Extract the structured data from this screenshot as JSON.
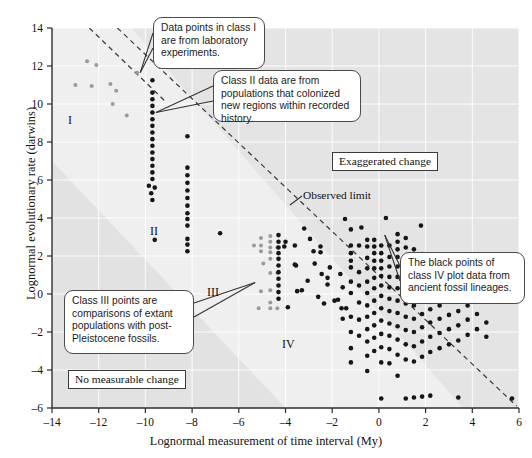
{
  "chart_data": {
    "type": "scatter",
    "title": "",
    "xlabel": "Lognormal measurement of time interval (My)",
    "ylabel": "Lognormal evolutionary rate (darwins)",
    "xlim": [
      -14,
      6
    ],
    "ylim": [
      -6,
      14
    ],
    "xticks": [
      -14,
      -12,
      -10,
      -8,
      -6,
      -4,
      -2,
      0,
      2,
      4,
      6
    ],
    "xtick_labels": [
      "–14",
      "–12",
      "–10",
      "–8",
      "–6",
      "–4",
      "–2",
      "0",
      "2",
      "4",
      "6"
    ],
    "yticks": [
      -6,
      -4,
      -2,
      0,
      2,
      4,
      6,
      8,
      10,
      12,
      14
    ],
    "ytick_labels": [
      "–6",
      "–4",
      "–2",
      "0",
      "2",
      "4",
      "6",
      "8",
      "10",
      "12",
      "14"
    ],
    "grid": true,
    "legend_position": "none",
    "colors": {
      "class_light": "#9a9a9a",
      "class_dark": "#161616",
      "shade_upper": "#e3e3e3",
      "shade_lower": "#e0e0e0",
      "axis": "#2b2b2b",
      "grid": "#ffffff",
      "dashed_line": "#3a3a3a"
    },
    "series": [
      {
        "name": "Class I",
        "style": "light",
        "points": [
          [
            -13.0,
            11.0
          ],
          [
            -12.5,
            12.25
          ],
          [
            -12.3,
            10.95
          ],
          [
            -12.1,
            12.05
          ],
          [
            -11.5,
            11.05
          ],
          [
            -11.25,
            10.7
          ],
          [
            -11.4,
            10.0
          ],
          [
            -10.8,
            9.4
          ],
          [
            -10.35,
            11.65
          ]
        ]
      },
      {
        "name": "Class II",
        "style": "dark",
        "points": [
          [
            -9.7,
            11.25
          ],
          [
            -9.7,
            10.6
          ],
          [
            -9.7,
            10.25
          ],
          [
            -9.7,
            9.9
          ],
          [
            -9.7,
            9.55
          ],
          [
            -9.7,
            9.2
          ],
          [
            -9.7,
            8.85
          ],
          [
            -9.7,
            8.5
          ],
          [
            -9.7,
            8.15
          ],
          [
            -9.7,
            7.8
          ],
          [
            -9.7,
            7.45
          ],
          [
            -9.7,
            7.1
          ],
          [
            -9.7,
            6.75
          ],
          [
            -9.7,
            6.4
          ],
          [
            -9.7,
            6.05
          ],
          [
            -9.85,
            5.7
          ],
          [
            -9.6,
            5.6
          ],
          [
            -9.75,
            5.3
          ],
          [
            -9.7,
            4.95
          ],
          [
            -8.2,
            8.3
          ],
          [
            -8.2,
            6.65
          ],
          [
            -8.2,
            6.25
          ],
          [
            -8.2,
            5.85
          ],
          [
            -8.2,
            5.45
          ],
          [
            -8.2,
            5.05
          ],
          [
            -8.2,
            4.65
          ],
          [
            -8.2,
            4.25
          ],
          [
            -8.2,
            3.95
          ],
          [
            -8.2,
            3.6
          ],
          [
            -8.2,
            2.9
          ],
          [
            -8.2,
            2.6
          ],
          [
            -8.2,
            2.25
          ],
          [
            -9.6,
            2.85
          ],
          [
            -6.8,
            3.2
          ]
        ]
      },
      {
        "name": "Class III",
        "style": "light",
        "points": [
          [
            -5.05,
            2.95
          ],
          [
            -5.05,
            2.55
          ],
          [
            -5.05,
            2.25
          ],
          [
            -4.65,
            3.05
          ],
          [
            -4.65,
            2.75
          ],
          [
            -4.65,
            2.45
          ],
          [
            -4.65,
            2.2
          ],
          [
            -4.65,
            1.85
          ],
          [
            -4.65,
            1.1
          ],
          [
            -4.65,
            0.2
          ],
          [
            -4.65,
            -0.45
          ],
          [
            -4.65,
            -0.75
          ],
          [
            -4.35,
            -0.75
          ],
          [
            -4.35,
            1.1
          ],
          [
            -4.35,
            2.45
          ],
          [
            -5.15,
            -0.75
          ],
          [
            -5.05,
            0.15
          ],
          [
            -5.35,
            2.55
          ],
          [
            -4.95,
            1.6
          ]
        ]
      },
      {
        "name": "Class IV",
        "style": "dark",
        "points": [
          [
            -4.3,
            3.1
          ],
          [
            -4.3,
            2.75
          ],
          [
            -4.3,
            2.45
          ],
          [
            -4.3,
            2.15
          ],
          [
            -4.3,
            1.85
          ],
          [
            -4.3,
            1.5
          ],
          [
            -4.3,
            1.15
          ],
          [
            -4.3,
            0.8
          ],
          [
            -4.3,
            0.45
          ],
          [
            -4.3,
            0.1
          ],
          [
            -4.3,
            -0.25
          ],
          [
            -4.05,
            2.5
          ],
          [
            -4.0,
            2.75
          ],
          [
            -3.6,
            2.55
          ],
          [
            -3.9,
            -0.7
          ],
          [
            -3.55,
            1.5
          ],
          [
            -3.5,
            0.15
          ],
          [
            -3.3,
            0.2
          ],
          [
            -3.6,
            1.55
          ],
          [
            -2.8,
            2.25
          ],
          [
            -2.5,
            2.5
          ],
          [
            -2.5,
            2.2
          ],
          [
            -2.2,
            0.85
          ],
          [
            -2.2,
            0.5
          ],
          [
            -2.1,
            1.4
          ],
          [
            -1.75,
            -0.3
          ],
          [
            -1.6,
            -0.75
          ],
          [
            -1.4,
            -0.75
          ],
          [
            -1.2,
            3.4
          ],
          [
            -1.2,
            2.55
          ],
          [
            -1.2,
            2.15
          ],
          [
            -1.2,
            1.75
          ],
          [
            -1.2,
            1.4
          ],
          [
            -1.2,
            0.65
          ],
          [
            -1.2,
            0.05
          ],
          [
            -1.2,
            -1.2
          ],
          [
            -1.2,
            -2.0
          ],
          [
            -1.2,
            -2.85
          ],
          [
            -1.2,
            -3.6
          ],
          [
            -0.85,
            2.55
          ],
          [
            -0.85,
            1.15
          ],
          [
            -0.85,
            0.45
          ],
          [
            -0.85,
            -0.45
          ],
          [
            -0.85,
            -1.35
          ],
          [
            -0.85,
            -2.2
          ],
          [
            -1.55,
            0.35
          ],
          [
            -1.55,
            -1.3
          ],
          [
            -1.9,
            -0.35
          ],
          [
            -1.65,
            1.05
          ],
          [
            -0.5,
            2.85
          ],
          [
            -0.5,
            2.5
          ],
          [
            -0.5,
            1.9
          ],
          [
            -0.5,
            1.35
          ],
          [
            -0.5,
            0.65
          ],
          [
            -0.5,
            0.05
          ],
          [
            -0.5,
            -0.6
          ],
          [
            -0.5,
            -1.2
          ],
          [
            -0.5,
            -1.85
          ],
          [
            -0.5,
            -2.5
          ],
          [
            -0.5,
            -3.25
          ],
          [
            -0.5,
            -4.05
          ],
          [
            -0.2,
            2.85
          ],
          [
            -0.2,
            2.5
          ],
          [
            -0.2,
            2.15
          ],
          [
            -0.2,
            1.75
          ],
          [
            -0.2,
            1.35
          ],
          [
            -0.2,
            0.85
          ],
          [
            -0.2,
            0.3
          ],
          [
            -0.2,
            -0.35
          ],
          [
            -0.2,
            -1.0
          ],
          [
            -0.2,
            -1.65
          ],
          [
            -0.2,
            -2.3
          ],
          [
            -0.2,
            -3.0
          ],
          [
            0.1,
            2.55
          ],
          [
            0.1,
            2.15
          ],
          [
            0.1,
            1.75
          ],
          [
            0.1,
            1.35
          ],
          [
            0.1,
            0.95
          ],
          [
            0.1,
            0.45
          ],
          [
            0.1,
            -0.1
          ],
          [
            0.1,
            -0.75
          ],
          [
            0.1,
            -1.4
          ],
          [
            0.1,
            -2.1
          ],
          [
            0.1,
            -2.8
          ],
          [
            0.1,
            -3.6
          ],
          [
            0.1,
            -5.5
          ],
          [
            0.45,
            2.55
          ],
          [
            0.45,
            1.95
          ],
          [
            0.45,
            1.45
          ],
          [
            0.45,
            0.9
          ],
          [
            0.45,
            0.35
          ],
          [
            0.45,
            -0.25
          ],
          [
            0.45,
            -0.9
          ],
          [
            0.45,
            -1.55
          ],
          [
            0.45,
            -2.2
          ],
          [
            0.45,
            -2.9
          ],
          [
            0.45,
            -3.65
          ],
          [
            0.8,
            3.15
          ],
          [
            0.8,
            2.75
          ],
          [
            0.8,
            2.35
          ],
          [
            0.8,
            1.95
          ],
          [
            0.8,
            1.45
          ],
          [
            0.8,
            0.9
          ],
          [
            0.8,
            0.3
          ],
          [
            0.8,
            -0.35
          ],
          [
            0.8,
            -1.0
          ],
          [
            0.8,
            -1.7
          ],
          [
            0.8,
            -2.4
          ],
          [
            0.8,
            -3.2
          ],
          [
            0.8,
            -4.3
          ],
          [
            1.15,
            2.95
          ],
          [
            1.15,
            2.45
          ],
          [
            1.15,
            1.95
          ],
          [
            1.15,
            1.4
          ],
          [
            1.15,
            0.8
          ],
          [
            1.15,
            0.15
          ],
          [
            1.15,
            -0.5
          ],
          [
            1.15,
            -1.2
          ],
          [
            1.15,
            -1.9
          ],
          [
            1.15,
            -2.65
          ],
          [
            1.15,
            -3.45
          ],
          [
            1.15,
            -5.5
          ],
          [
            1.5,
            2.35
          ],
          [
            1.5,
            1.85
          ],
          [
            1.5,
            1.3
          ],
          [
            1.5,
            0.7
          ],
          [
            1.5,
            0.05
          ],
          [
            1.5,
            -0.6
          ],
          [
            1.5,
            -1.3
          ],
          [
            1.5,
            -2.0
          ],
          [
            1.5,
            -2.75
          ],
          [
            1.5,
            -3.55
          ],
          [
            1.5,
            -5.45
          ],
          [
            1.85,
            2.1
          ],
          [
            1.85,
            1.55
          ],
          [
            1.85,
            0.95
          ],
          [
            1.85,
            0.3
          ],
          [
            1.85,
            -0.35
          ],
          [
            1.85,
            -1.05
          ],
          [
            1.85,
            -1.75
          ],
          [
            1.85,
            -2.5
          ],
          [
            1.85,
            -3.3
          ],
          [
            1.85,
            -5.4
          ],
          [
            2.2,
            1.75
          ],
          [
            2.2,
            1.15
          ],
          [
            2.2,
            0.55
          ],
          [
            2.2,
            -0.1
          ],
          [
            2.2,
            -0.8
          ],
          [
            2.2,
            -1.5
          ],
          [
            2.2,
            -2.25
          ],
          [
            2.2,
            -3.05
          ],
          [
            2.2,
            -5.35
          ],
          [
            2.6,
            1.35
          ],
          [
            2.6,
            0.75
          ],
          [
            2.6,
            0.1
          ],
          [
            2.6,
            -0.6
          ],
          [
            2.6,
            -1.3
          ],
          [
            2.6,
            -2.05
          ],
          [
            2.6,
            -2.85
          ],
          [
            3.0,
            0.95
          ],
          [
            3.0,
            0.3
          ],
          [
            3.0,
            -0.4
          ],
          [
            3.0,
            -1.1
          ],
          [
            3.0,
            -1.85
          ],
          [
            3.0,
            -2.65
          ],
          [
            3.4,
            0.5
          ],
          [
            3.4,
            -0.2
          ],
          [
            3.4,
            -0.9
          ],
          [
            3.4,
            -1.65
          ],
          [
            3.4,
            -2.45
          ],
          [
            3.4,
            -5.45
          ],
          [
            3.8,
            0.1
          ],
          [
            3.8,
            -0.6
          ],
          [
            3.8,
            -1.35
          ],
          [
            3.8,
            -2.15
          ],
          [
            4.2,
            -0.3
          ],
          [
            4.2,
            -1.05
          ],
          [
            4.2,
            -1.85
          ],
          [
            4.6,
            -1.5
          ],
          [
            4.6,
            -2.25
          ],
          [
            5.7,
            -5.5
          ],
          [
            -3.2,
            3.45
          ],
          [
            -2.95,
            2.9
          ],
          [
            -2.6,
            -0.15
          ],
          [
            -2.35,
            -0.5
          ],
          [
            -2.75,
            1.6
          ],
          [
            -3.05,
            0.7
          ],
          [
            -2.45,
            1.05
          ],
          [
            0.3,
            4.0
          ],
          [
            -0.75,
            3.5
          ],
          [
            1.8,
            3.6
          ],
          [
            -1.45,
            3.95
          ]
        ]
      }
    ]
  },
  "annotations": {
    "callouts": [
      {
        "id": "callout-class-i",
        "text": "Data points in class I are from laboratory experiments."
      },
      {
        "id": "callout-class-ii",
        "text": "Class II data are from populations that colonized new regions within recorded history."
      },
      {
        "id": "callout-class-iii",
        "text": "Class III points are comparisons of extant populations with post-Pleistocene fossils."
      },
      {
        "id": "callout-class-iv",
        "text": "The black points of class IV plot data from ancient fossil lineages."
      }
    ],
    "boxed": [
      {
        "id": "box-exaggerated",
        "text": "Exaggerated change"
      },
      {
        "id": "box-no-change",
        "text": "No measurable change"
      }
    ],
    "plain": [
      {
        "id": "label-observed-limit",
        "text": "Observed limit"
      }
    ],
    "class_markers": [
      {
        "id": "class-marker-i",
        "text": "I"
      },
      {
        "id": "class-marker-ii",
        "text": "II"
      },
      {
        "id": "class-marker-iii",
        "text": "III"
      },
      {
        "id": "class-marker-iv",
        "text": "IV"
      }
    ]
  }
}
